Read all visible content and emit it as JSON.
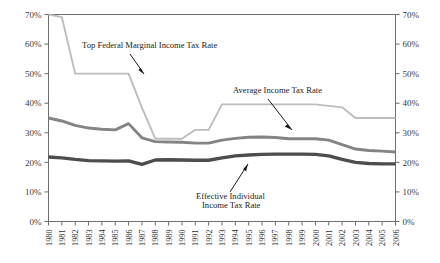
{
  "chart_data": {
    "type": "line",
    "title": "",
    "xlabel": "",
    "ylabel": "",
    "ylim": [
      0,
      70
    ],
    "ytick_labels": [
      "0%",
      "10%",
      "20%",
      "30%",
      "40%",
      "50%",
      "60%",
      "70%"
    ],
    "ytick_values": [
      0,
      10,
      20,
      30,
      40,
      50,
      60,
      70
    ],
    "right_axis_labels": [
      "0%",
      "10%",
      "20%",
      "30%",
      "40%",
      "50%",
      "60%",
      "70%"
    ],
    "grid": false,
    "legend": "annotations",
    "categories": [
      "1980",
      "1981",
      "1982",
      "1983",
      "1984",
      "1985",
      "1986",
      "1987",
      "1988",
      "1989",
      "1990",
      "1991",
      "1992",
      "1993",
      "1994",
      "1995",
      "1996",
      "1997",
      "1998",
      "1999",
      "2000",
      "2001",
      "2002",
      "2003",
      "2004",
      "2005",
      "2006"
    ],
    "series": [
      {
        "name": "Top Federal Marginal Income Tax Rate",
        "color": "#bdbdbd",
        "values": [
          70.0,
          69.1,
          50.0,
          50.0,
          50.0,
          50.0,
          50.0,
          38.5,
          28.0,
          28.0,
          28.0,
          31.0,
          31.0,
          39.6,
          39.6,
          39.6,
          39.6,
          39.6,
          39.6,
          39.6,
          39.6,
          39.1,
          38.6,
          35.0,
          35.0,
          35.0,
          35.0
        ]
      },
      {
        "name": "Average Income Tax Rate",
        "color": "#848484",
        "values": [
          35.0,
          34.0,
          32.5,
          31.6,
          31.2,
          31.0,
          33.1,
          28.3,
          27.0,
          26.9,
          26.8,
          26.5,
          26.5,
          27.5,
          28.1,
          28.5,
          28.6,
          28.4,
          28.0,
          28.0,
          28.0,
          27.5,
          26.0,
          24.5,
          24.0,
          23.8,
          23.5
        ]
      },
      {
        "name": "Effective Individual Income Tax Rate",
        "color": "#4d4d4d",
        "values": [
          21.8,
          21.5,
          21.0,
          20.6,
          20.5,
          20.4,
          20.5,
          19.3,
          20.8,
          20.9,
          20.8,
          20.7,
          20.7,
          21.5,
          22.2,
          22.5,
          22.7,
          22.8,
          22.8,
          22.8,
          22.7,
          22.2,
          21.0,
          20.0,
          19.6,
          19.5,
          19.5
        ]
      }
    ],
    "annotations": [
      {
        "id": "top-marginal",
        "text": "Top Federal Marginal Income Tax Rate",
        "series": "Top Federal Marginal Income Tax Rate"
      },
      {
        "id": "average",
        "text": "Average Income Tax Rate",
        "series": "Average Income Tax Rate"
      },
      {
        "id": "effective-line1",
        "text": "Effective Individual",
        "series": "Effective Individual Income Tax Rate"
      },
      {
        "id": "effective-line2",
        "text": "Income Tax Rate",
        "series": "Effective Individual Income Tax Rate"
      }
    ]
  },
  "axes": {
    "left": {
      "ticks": [
        "70%",
        "60%",
        "50%",
        "40%",
        "30%",
        "20%",
        "10%",
        "0%"
      ]
    },
    "right": {
      "ticks": [
        "70%",
        "60%",
        "50%",
        "40%",
        "30%",
        "20%",
        "10%",
        "0%"
      ]
    },
    "bottom": {
      "ticks": [
        "1980",
        "1981",
        "1982",
        "1983",
        "1984",
        "1985",
        "1986",
        "1987",
        "1988",
        "1989",
        "1990",
        "1991",
        "1992",
        "1993",
        "1994",
        "1995",
        "1996",
        "1997",
        "1998",
        "1999",
        "2000",
        "2001",
        "2002",
        "2003",
        "2004",
        "2005",
        "2006"
      ]
    }
  },
  "annotation_labels": {
    "top_marginal": "Top Federal Marginal Income Tax Rate",
    "average": "Average Income Tax Rate",
    "effective_line1": "Effective Individual",
    "effective_line2": "Income Tax Rate"
  },
  "colors": {
    "top_marginal_line": "#bdbdbd",
    "average_line": "#848484",
    "effective_line": "#4d4d4d",
    "frame": "#6e6e6e",
    "text": "#1d1d1d",
    "background": "#ffffff"
  }
}
